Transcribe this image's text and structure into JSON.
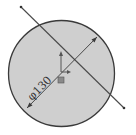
{
  "sketch": {
    "circle": {
      "cx": 61.5,
      "cy": 73.5,
      "r": 53,
      "fill": "#cfcfcf",
      "stroke": "#3a3a3a"
    },
    "construction_line": {
      "x1": 21,
      "y1": 7,
      "x2": 124,
      "y2": 108,
      "color": "#4a4a4a"
    },
    "diameter_dimension": {
      "label": "φ130",
      "x1": 27,
      "y1": 108,
      "x2": 97,
      "y2": 37,
      "color": "#3a3a3a"
    },
    "origin": {
      "x": 61,
      "y": 72
    }
  }
}
